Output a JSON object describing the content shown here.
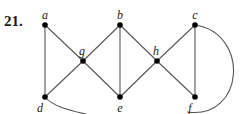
{
  "problem_number": "21.",
  "graph": {
    "nodes": [
      {
        "id": "a",
        "label": "a",
        "row": "top",
        "col": 0
      },
      {
        "id": "b",
        "label": "b",
        "row": "top",
        "col": 2
      },
      {
        "id": "c",
        "label": "c",
        "row": "top",
        "col": 4
      },
      {
        "id": "g",
        "label": "g",
        "row": "middle",
        "col": 1
      },
      {
        "id": "h",
        "label": "h",
        "row": "middle",
        "col": 3
      },
      {
        "id": "d",
        "label": "d",
        "row": "bottom",
        "col": 0
      },
      {
        "id": "e",
        "label": "e",
        "row": "bottom",
        "col": 2
      },
      {
        "id": "f",
        "label": "f",
        "row": "bottom",
        "col": 4
      }
    ],
    "edges": [
      {
        "from": "a",
        "to": "d",
        "type": "straight"
      },
      {
        "from": "a",
        "to": "g",
        "type": "straight"
      },
      {
        "from": "g",
        "to": "d",
        "type": "straight"
      },
      {
        "from": "g",
        "to": "b",
        "type": "straight"
      },
      {
        "from": "g",
        "to": "e",
        "type": "straight"
      },
      {
        "from": "b",
        "to": "e",
        "type": "straight"
      },
      {
        "from": "b",
        "to": "h",
        "type": "straight"
      },
      {
        "from": "e",
        "to": "h",
        "type": "straight"
      },
      {
        "from": "h",
        "to": "c",
        "type": "straight"
      },
      {
        "from": "h",
        "to": "f",
        "type": "straight"
      },
      {
        "from": "c",
        "to": "f",
        "type": "straight"
      },
      {
        "from": "d",
        "to": "f",
        "type": "curved",
        "note": "curve exits bottom of view"
      },
      {
        "from": "c",
        "to": "f",
        "type": "curved-right"
      }
    ]
  }
}
